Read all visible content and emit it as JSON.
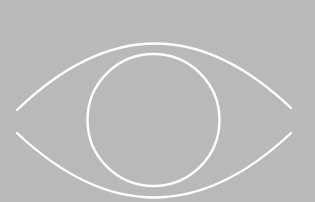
{
  "image": {
    "subject": "eye-outline",
    "background_color": "#b9b9b9",
    "stroke_color": "#ffffff",
    "stroke_width": 2.4,
    "upper_lid": {
      "start": [
        17,
        110
      ],
      "control": [
        154,
        -22
      ],
      "end": [
        291,
        108
      ]
    },
    "lower_lid": {
      "start": [
        17,
        133
      ],
      "control": [
        154,
        262
      ],
      "end": [
        291,
        133
      ]
    },
    "iris": {
      "cx": 153.5,
      "cy": 120,
      "r": 66
    }
  }
}
